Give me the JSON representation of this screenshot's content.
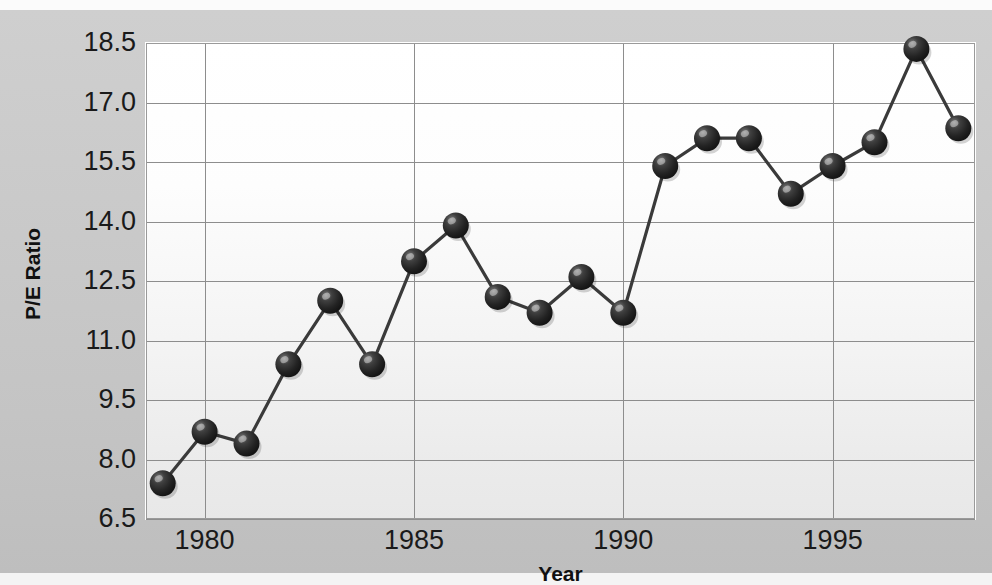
{
  "chart_data": {
    "type": "line",
    "title": "",
    "xlabel": "Year",
    "ylabel": "P/E Ratio",
    "grid": true,
    "legend": "none",
    "marker": "sphere",
    "marker_color": "#2b2b2b",
    "line_color": "#3a3a3a",
    "plot_background": "#f7f7f7",
    "figure_background": "#c8c8c8",
    "xlim": [
      1978.6,
      1998.4
    ],
    "ylim": [
      6.5,
      18.5
    ],
    "x_ticks": [
      1980,
      1985,
      1990,
      1995
    ],
    "x_tick_labels": [
      "1980",
      "1985",
      "1990",
      "1995"
    ],
    "y_ticks": [
      6.5,
      8.0,
      9.5,
      11.0,
      12.5,
      14.0,
      15.5,
      17.0,
      18.5
    ],
    "y_tick_labels": [
      "6.5",
      "8.0",
      "9.5",
      "11.0",
      "12.5",
      "14.0",
      "15.5",
      "17.0",
      "18.5"
    ],
    "x": [
      1979,
      1980,
      1981,
      1982,
      1983,
      1984,
      1985,
      1986,
      1987,
      1988,
      1989,
      1990,
      1991,
      1992,
      1993,
      1994,
      1995,
      1996,
      1997,
      1998
    ],
    "values": [
      7.4,
      8.7,
      8.4,
      10.4,
      12.0,
      10.4,
      13.0,
      13.9,
      12.1,
      11.7,
      12.6,
      11.7,
      15.4,
      16.1,
      16.1,
      14.7,
      15.4,
      16.0,
      18.35,
      16.35
    ],
    "categories": [
      "1979",
      "1980",
      "1981",
      "1982",
      "1983",
      "1984",
      "1985",
      "1986",
      "1987",
      "1988",
      "1989",
      "1990",
      "1991",
      "1992",
      "1993",
      "1994",
      "1995",
      "1996",
      "1997",
      "1998"
    ],
    "series": [
      {
        "name": "P/E Ratio",
        "values": [
          7.4,
          8.7,
          8.4,
          10.4,
          12.0,
          10.4,
          13.0,
          13.9,
          12.1,
          11.7,
          12.6,
          11.7,
          15.4,
          16.1,
          16.1,
          14.7,
          15.4,
          16.0,
          18.35,
          16.35
        ]
      }
    ]
  },
  "axes": {
    "x_title": "Year",
    "y_title": "P/E Ratio"
  }
}
